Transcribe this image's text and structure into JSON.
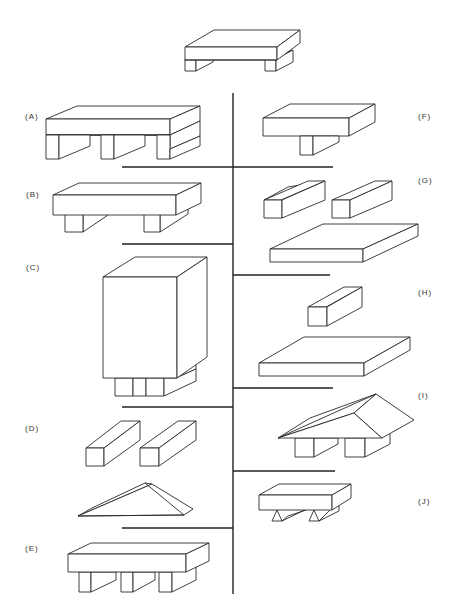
{
  "diagram": {
    "type": "classification tree of block structures",
    "target": {
      "name": "target-structure",
      "description": "slab on two legs"
    },
    "left_options": [
      {
        "label": "(A)",
        "description": "thick slab on three legs"
      },
      {
        "label": "(B)",
        "description": "slab on two legs"
      },
      {
        "label": "(C)",
        "description": "tall block on two small legs"
      },
      {
        "label": "(D)",
        "description": "two separate bars and a triangular prism"
      },
      {
        "label": "(E)",
        "description": "slab on three legs"
      }
    ],
    "right_options": [
      {
        "label": "(F)",
        "description": "slab on one central leg"
      },
      {
        "label": "(G)",
        "description": "two separate bars and a flat slab"
      },
      {
        "label": "(H)",
        "description": "one bar and a flat slab"
      },
      {
        "label": "(I)",
        "description": "triangular roof on two legs"
      },
      {
        "label": "(J)",
        "description": "slab on two triangular supports"
      }
    ]
  }
}
